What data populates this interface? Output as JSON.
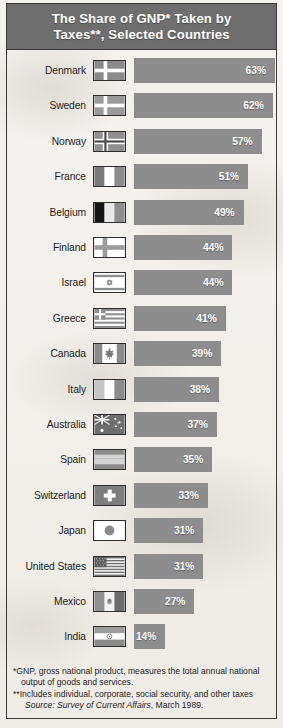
{
  "title": {
    "line1": "The Share of GNP* Taken by",
    "line2": "Taxes**, Selected Countries",
    "full": "The Share of GNP* Taken by Taxes**, Selected Countries"
  },
  "footnotes": {
    "gnp_line1": "*GNP, gross national product, measures the total annual national",
    "gnp_line2": "output of goods and services.",
    "taxes_line": "**Includes individual, corporate, social security, and other taxes",
    "source_prefix": "Source: ",
    "source_italic": "Survey of Current Affairs",
    "source_suffix": ", March 1989."
  },
  "colors": {
    "header_band": "#6e6e6e",
    "bar_fill": "#8d8d8d",
    "frame_border": "#3a3a3a",
    "page_background": "#f2efeb",
    "value_text": "#ffffff",
    "label_text": "#1d1d1d"
  },
  "chart_data": {
    "type": "bar",
    "title": "The Share of GNP* Taken by Taxes**, Selected Countries",
    "xlabel": "",
    "ylabel": "",
    "orientation": "horizontal",
    "xlim": [
      0,
      63
    ],
    "grid": false,
    "legend": false,
    "unit": "%",
    "categories": [
      "Denmark",
      "Sweden",
      "Norway",
      "France",
      "Belgium",
      "Finland",
      "Israel",
      "Greece",
      "Canada",
      "Italy",
      "Australia",
      "Spain",
      "Switzerland",
      "Japan",
      "United States",
      "Mexico",
      "India"
    ],
    "values": [
      63,
      62,
      57,
      51,
      49,
      44,
      44,
      41,
      39,
      38,
      37,
      35,
      33,
      31,
      31,
      27,
      14
    ],
    "rows": [
      {
        "country": "Denmark",
        "value": 63,
        "label": "63%",
        "flag": "flag-denmark"
      },
      {
        "country": "Sweden",
        "value": 62,
        "label": "62%",
        "flag": "flag-sweden"
      },
      {
        "country": "Norway",
        "value": 57,
        "label": "57%",
        "flag": "flag-norway"
      },
      {
        "country": "France",
        "value": 51,
        "label": "51%",
        "flag": "flag-france"
      },
      {
        "country": "Belgium",
        "value": 49,
        "label": "49%",
        "flag": "flag-belgium"
      },
      {
        "country": "Finland",
        "value": 44,
        "label": "44%",
        "flag": "flag-finland"
      },
      {
        "country": "Israel",
        "value": 44,
        "label": "44%",
        "flag": "flag-israel"
      },
      {
        "country": "Greece",
        "value": 41,
        "label": "41%",
        "flag": "flag-greece"
      },
      {
        "country": "Canada",
        "value": 39,
        "label": "39%",
        "flag": "flag-canada"
      },
      {
        "country": "Italy",
        "value": 38,
        "label": "38%",
        "flag": "flag-italy"
      },
      {
        "country": "Australia",
        "value": 37,
        "label": "37%",
        "flag": "flag-australia"
      },
      {
        "country": "Spain",
        "value": 35,
        "label": "35%",
        "flag": "flag-spain"
      },
      {
        "country": "Switzerland",
        "value": 33,
        "label": "33%",
        "flag": "flag-switzerland"
      },
      {
        "country": "Japan",
        "value": 31,
        "label": "31%",
        "flag": "flag-japan"
      },
      {
        "country": "United States",
        "value": 31,
        "label": "31%",
        "flag": "flag-united-states"
      },
      {
        "country": "Mexico",
        "value": 27,
        "label": "27%",
        "flag": "flag-mexico"
      },
      {
        "country": "India",
        "value": 14,
        "label": "14%",
        "flag": "flag-india"
      }
    ]
  }
}
